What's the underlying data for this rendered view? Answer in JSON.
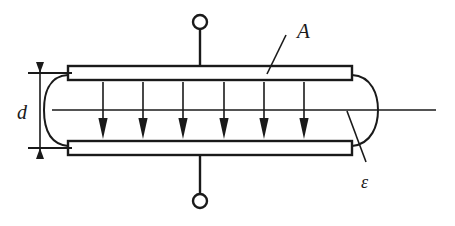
{
  "figure": {
    "background_color": "#ffffff",
    "line_color": "#1a1a1a"
  },
  "labels": {
    "area": "A",
    "separation": "d",
    "permittivity": "ε"
  },
  "diagram": {
    "top_plate": {
      "x": 68,
      "y": 66,
      "width": 284,
      "height": 14
    },
    "bottom_plate": {
      "x": 68,
      "y": 141,
      "width": 284,
      "height": 14
    },
    "top_terminal_circle": {
      "cx": 200,
      "cy": 22,
      "r": 7
    },
    "bottom_terminal_circle": {
      "cx": 200,
      "cy": 201,
      "r": 7
    },
    "top_lead": {
      "x": 200,
      "y1": 29,
      "y2": 66
    },
    "bottom_lead": {
      "x": 200,
      "y1": 155,
      "y2": 194
    },
    "field_arrows_count": 6,
    "field_arrow_x_positions": [
      103,
      143,
      183,
      224,
      264,
      304
    ],
    "field_arrow_top_y": 82,
    "field_arrow_bottom_y": 139,
    "dielectric_left_arc_x": 52,
    "dielectric_right_arc_x": 376,
    "center_line": {
      "x1": 52,
      "x2": 436,
      "y": 110
    },
    "dimension_line": {
      "x": 40,
      "y_top": 73,
      "y_bottom": 148
    },
    "leader_a": {
      "x1": 286,
      "y1": 35,
      "x2": 268,
      "y2": 73
    },
    "leader_epsilon": {
      "x1": 366,
      "y1": 163,
      "x2": 348,
      "y2": 112
    }
  }
}
